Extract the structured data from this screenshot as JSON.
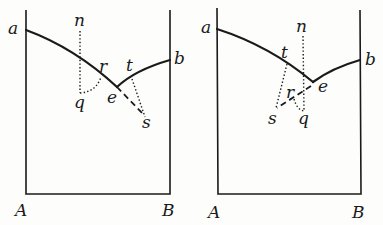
{
  "figures": [
    {
      "id": "left",
      "labels": {
        "a": "a",
        "b": "b",
        "A": "A",
        "B": "B",
        "n": "n",
        "q": "q",
        "r": "r",
        "e": "e",
        "t": "t",
        "s": "s"
      }
    },
    {
      "id": "right",
      "labels": {
        "a": "a",
        "b": "b",
        "A": "A",
        "B": "B",
        "n": "n",
        "q": "q",
        "r": "r",
        "e": "e",
        "t": "t",
        "s": "s"
      }
    }
  ],
  "colors": {
    "ink": "#1a1a1a",
    "paper": "#fdfdfb"
  }
}
